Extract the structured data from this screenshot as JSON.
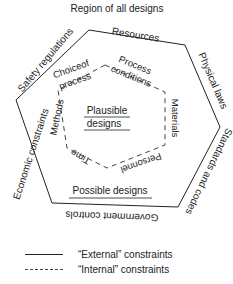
{
  "title": "Region of all designs",
  "outer_hexagon": {
    "style": "solid",
    "sides": [
      {
        "label": "Resources"
      },
      {
        "label": "Physical laws"
      },
      {
        "label": "Standards and codes"
      },
      {
        "label": "Government controls"
      },
      {
        "label": "Economic constraints"
      },
      {
        "label": "Safety regulations"
      }
    ],
    "region_label": "Possible designs"
  },
  "inner_hexagon": {
    "style": "dashed",
    "sides": [
      {
        "label": "Process conditions",
        "line1": "Process",
        "line2": "conditions"
      },
      {
        "label": "Materials"
      },
      {
        "label": "Personnel"
      },
      {
        "label": "Time"
      },
      {
        "label": "Methods"
      },
      {
        "label": "Choice of process",
        "line1": "Choiceof",
        "line2": "process"
      }
    ],
    "region_label": "Plausible designs",
    "region_line1": "Plausible",
    "region_line2": "designs"
  },
  "legend": [
    {
      "style": "solid",
      "label": "“External” constraints"
    },
    {
      "style": "dashed",
      "label": "“Internal” constraints"
    }
  ],
  "colors": {
    "line": "#222222",
    "background": "#ffffff"
  }
}
